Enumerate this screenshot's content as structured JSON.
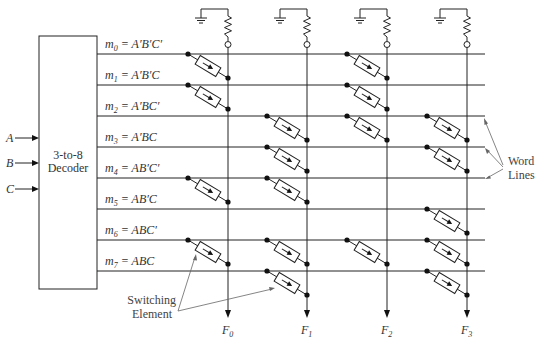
{
  "decoder": {
    "line1": "3-to-8",
    "line2": "Decoder",
    "inputs": [
      "A",
      "B",
      "C"
    ]
  },
  "word_lines": [
    {
      "id": "m0",
      "sub": "0",
      "expr": "A′B′C′"
    },
    {
      "id": "m1",
      "sub": "1",
      "expr": "A′B′C"
    },
    {
      "id": "m2",
      "sub": "2",
      "expr": "A′BC′"
    },
    {
      "id": "m3",
      "sub": "3",
      "expr": "A′BC"
    },
    {
      "id": "m4",
      "sub": "4",
      "expr": "AB′C′"
    },
    {
      "id": "m5",
      "sub": "5",
      "expr": "AB′C"
    },
    {
      "id": "m6",
      "sub": "6",
      "expr": "ABC′"
    },
    {
      "id": "m7",
      "sub": "7",
      "expr": "ABC"
    }
  ],
  "outputs": [
    {
      "name": "F",
      "sub": "0"
    },
    {
      "name": "F",
      "sub": "1"
    },
    {
      "name": "F",
      "sub": "2"
    },
    {
      "name": "F",
      "sub": "3"
    }
  ],
  "switching_elements": {
    "m0": [
      "F0",
      "F2"
    ],
    "m1": [
      "F0",
      "F2"
    ],
    "m2": [
      "F1",
      "F2",
      "F3"
    ],
    "m3": [
      "F1",
      "F3"
    ],
    "m4": [
      "F0",
      "F1"
    ],
    "m5": [
      "F3"
    ],
    "m6": [
      "F0",
      "F1",
      "F2",
      "F3"
    ],
    "m7": [
      "F1",
      "F3"
    ]
  },
  "annotations": {
    "word_lines_1": "Word",
    "word_lines_2": "Lines",
    "switching_1": "Switching",
    "switching_2": "Element"
  },
  "colors": {
    "line": "#222222",
    "text": "#333333",
    "background": "#ffffff"
  }
}
